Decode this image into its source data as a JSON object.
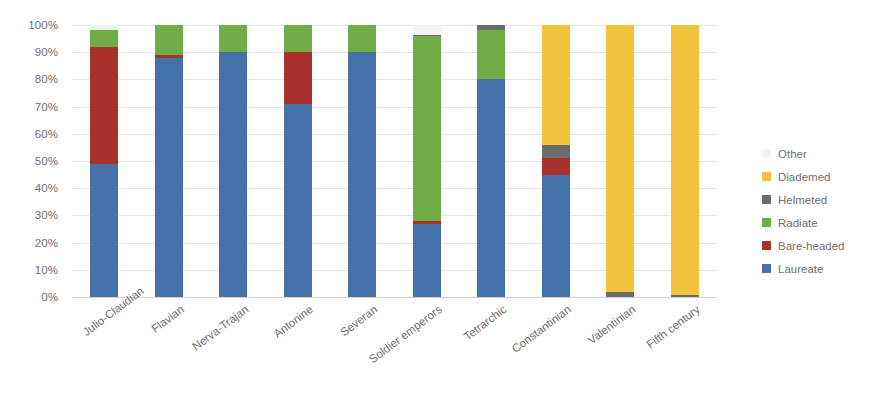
{
  "chart_data": {
    "type": "bar",
    "subtype": "100% stacked column",
    "title": "",
    "xlabel": "",
    "ylabel": "",
    "ylim": [
      0,
      100
    ],
    "y_tick_labels": [
      "0%",
      "10%",
      "20%",
      "30%",
      "40%",
      "50%",
      "60%",
      "70%",
      "80%",
      "90%",
      "100%"
    ],
    "y_tick_values": [
      0,
      10,
      20,
      30,
      40,
      50,
      60,
      70,
      80,
      90,
      100
    ],
    "grid": true,
    "legend_position": "right",
    "categories": [
      "Julio-Claudian",
      "Flavian",
      "Nerva-Trajan",
      "Antonine",
      "Severan",
      "Soldier emperors",
      "Tetrarchic",
      "Constantinian",
      "Valentinian",
      "Fifth century"
    ],
    "series": [
      {
        "name": "Laureate",
        "color": "#4472A8",
        "values": [
          49,
          88,
          90,
          71,
          90,
          27,
          80,
          45,
          0,
          0
        ]
      },
      {
        "name": "Bare-headed",
        "color": "#A8322B",
        "values": [
          43,
          1,
          0,
          19,
          0,
          1,
          0,
          6,
          0,
          0
        ]
      },
      {
        "name": "Radiate",
        "color": "#70AD47",
        "values": [
          6,
          11,
          10,
          10,
          10,
          68,
          18,
          0,
          0,
          0
        ]
      },
      {
        "name": "Helmeted",
        "color": "#6C6C6C",
        "values": [
          0,
          0,
          0,
          0,
          0,
          0.5,
          2,
          5,
          2,
          0.7
        ]
      },
      {
        "name": "Diademed",
        "color": "#F0C33C",
        "values": [
          0,
          0,
          0,
          0,
          0,
          0,
          0,
          44,
          98,
          99.3
        ]
      },
      {
        "name": "Other",
        "color": "#F3F3F3",
        "values": [
          2,
          0,
          0,
          0,
          0,
          3.5,
          0,
          0,
          0,
          0
        ]
      }
    ],
    "legend_entries": [
      {
        "label": "Other",
        "color": "#F3F3F3"
      },
      {
        "label": "Diademed",
        "color": "#F0C33C"
      },
      {
        "label": "Helmeted",
        "color": "#6C6C6C"
      },
      {
        "label": "Radiate",
        "color": "#70AD47"
      },
      {
        "label": "Bare-headed",
        "color": "#A8322B"
      },
      {
        "label": "Laureate",
        "color": "#4472A8"
      }
    ]
  },
  "colors": {
    "laureate": "#4472A8",
    "bare_headed": "#A8322B",
    "radiate": "#70AD47",
    "helmeted": "#6C6C6C",
    "diademed": "#F0C33C",
    "other": "#F3F3F3",
    "gridline": "#E4E4E4",
    "text": "#6F6F6F",
    "background": "#FFFFFF"
  }
}
